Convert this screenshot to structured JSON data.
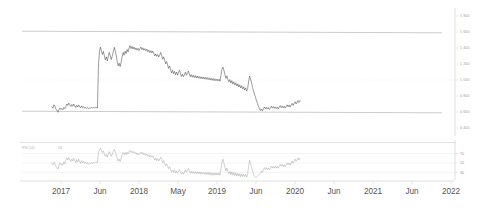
{
  "chart_data": {
    "type": "line",
    "title": "",
    "subtitle": "",
    "xlabel": "",
    "ylabel": "",
    "grid": true,
    "legend_position": "none",
    "x_tick_labels": [
      "2017",
      "Jun",
      "2018",
      "May",
      "2019",
      "Jun",
      "2020",
      "Jun",
      "2021",
      "Jun",
      "2022"
    ],
    "x_tick_positions": [
      61,
      100,
      139,
      178,
      217,
      256,
      295,
      334,
      373,
      412,
      451
    ],
    "x_range": [
      "2016-11",
      "2022-03"
    ],
    "panels": [
      {
        "name": "price",
        "ylim": [
          0.3,
          1.9
        ],
        "y_tick_labels": [
          "1 800",
          "1 600",
          "1 400",
          "1 200",
          "1 000",
          "0 800",
          "0 600",
          "0 400"
        ],
        "y_tick_values": [
          1.8,
          1.6,
          1.4,
          1.2,
          1.0,
          0.8,
          0.6,
          0.4
        ],
        "reference_lines": [
          {
            "value": 1.6,
            "style": "solid"
          },
          {
            "value": 0.6,
            "style": "solid"
          }
        ],
        "gridlines_dotted": [
          1.0
        ],
        "series": [
          {
            "name": "price",
            "color": "#4a4a4a",
            "values": [
              0.665,
              0.648,
              0.69,
              0.672,
              0.636,
              0.618,
              0.596,
              0.626,
              0.65,
              0.632,
              0.644,
              0.628,
              0.658,
              0.642,
              0.672,
              0.7,
              0.682,
              0.712,
              0.69,
              0.668,
              0.694,
              0.672,
              0.7,
              0.678,
              0.656,
              0.684,
              0.662,
              0.688,
              0.666,
              0.65,
              0.676,
              0.654,
              0.668,
              0.648,
              0.66,
              0.644,
              0.656,
              0.64,
              0.652,
              0.648,
              0.655,
              0.65,
              0.656,
              0.652,
              0.658,
              0.654,
              0.65,
              1.18,
              1.35,
              1.412,
              1.368,
              1.32,
              1.358,
              1.3,
              1.252,
              1.29,
              1.24,
              1.298,
              1.345,
              1.3,
              1.255,
              1.3,
              1.352,
              1.408,
              1.36,
              1.3,
              1.232,
              1.175,
              1.21,
              1.168,
              1.226,
              1.29,
              1.345,
              1.31,
              1.36,
              1.33,
              1.382,
              1.352,
              1.398,
              1.43,
              1.392,
              1.42,
              1.388,
              1.412,
              1.38,
              1.4,
              1.372,
              1.396,
              1.368,
              1.39,
              1.412,
              1.38,
              1.402,
              1.372,
              1.392,
              1.365,
              1.386,
              1.352,
              1.374,
              1.342,
              1.368,
              1.338,
              1.362,
              1.33,
              1.3,
              1.325,
              1.295,
              1.32,
              1.288,
              1.31,
              1.345,
              1.305,
              1.26,
              1.29,
              1.245,
              1.2,
              1.232,
              1.188,
              1.145,
              1.175,
              1.13,
              1.088,
              1.12,
              1.078,
              1.108,
              1.068,
              1.1,
              1.06,
              1.092,
              1.122,
              1.082,
              1.045,
              1.072,
              1.04,
              1.068,
              1.098,
              1.058,
              1.085,
              1.112,
              1.075,
              1.04,
              1.068,
              1.035,
              1.06,
              1.03,
              1.055,
              1.025,
              1.05,
              1.022,
              1.045,
              1.018,
              1.042,
              1.015,
              1.038,
              1.012,
              1.035,
              1.008,
              1.03,
              1.005,
              1.028,
              1.0,
              1.022,
              0.996,
              1.018,
              0.992,
              1.015,
              0.99,
              1.012,
              0.988,
              1.01,
              0.985,
              1.06,
              1.135,
              1.162,
              1.12,
              1.068,
              1.02,
              1.052,
              1.008,
              0.978,
              1.005,
              0.962,
              0.992,
              0.95,
              0.978,
              0.938,
              0.965,
              0.925,
              0.952,
              0.912,
              0.94,
              0.9,
              0.928,
              0.888,
              0.915,
              0.875,
              0.902,
              0.862,
              0.89,
              0.98,
              1.05,
              1.012,
              0.96,
              0.905,
              0.862,
              0.82,
              0.78,
              0.742,
              0.705,
              0.672,
              0.64,
              0.618,
              0.638,
              0.615,
              0.642,
              0.662,
              0.638,
              0.66,
              0.636,
              0.655,
              0.632,
              0.652,
              0.672,
              0.648,
              0.668,
              0.645,
              0.665,
              0.642,
              0.662,
              0.64,
              0.66,
              0.68,
              0.656,
              0.676,
              0.652,
              0.672,
              0.648,
              0.668,
              0.69,
              0.665,
              0.688,
              0.662,
              0.685,
              0.708,
              0.682,
              0.705,
              0.728,
              0.7,
              0.722,
              0.745,
              0.718,
              0.74
            ]
          }
        ]
      },
      {
        "name": "rsi",
        "indicator_label": "RSI (14)",
        "indicator_value": "58",
        "ylim": [
          18,
          88
        ],
        "y_tick_labels": [
          "70",
          "50",
          "30"
        ],
        "y_tick_values": [
          70,
          50,
          30
        ],
        "series": [
          {
            "name": "rsi",
            "color": "#9b9b9b",
            "values": [
              49,
              46,
              52,
              48,
              43,
              40,
              37,
              44,
              50,
              46,
              48,
              45,
              52,
              48,
              55,
              60,
              56,
              62,
              57,
              53,
              58,
              54,
              60,
              55,
              50,
              57,
              52,
              58,
              53,
              49,
              55,
              50,
              53,
              49,
              52,
              48,
              51,
              47,
              50,
              49,
              50,
              49,
              51,
              50,
              52,
              51,
              50,
              72,
              78,
              81,
              77,
              72,
              75,
              69,
              64,
              68,
              62,
              69,
              74,
              69,
              64,
              69,
              74,
              79,
              73,
              67,
              60,
              54,
              58,
              53,
              60,
              67,
              72,
              68,
              72,
              68,
              73,
              69,
              74,
              77,
              72,
              75,
              71,
              74,
              70,
              72,
              68,
              71,
              67,
              70,
              73,
              69,
              72,
              67,
              70,
              66,
              69,
              64,
              67,
              63,
              66,
              62,
              65,
              60,
              56,
              60,
              55,
              59,
              54,
              58,
              62,
              57,
              51,
              55,
              49,
              44,
              48,
              43,
              38,
              42,
              36,
              31,
              35,
              30,
              34,
              29,
              33,
              28,
              32,
              36,
              31,
              26,
              30,
              26,
              30,
              35,
              30,
              34,
              38,
              33,
              28,
              32,
              28,
              32,
              27,
              31,
              27,
              31,
              27,
              31,
              26,
              31,
              26,
              30,
              26,
              30,
              25,
              30,
              25,
              30,
              24,
              29,
              24,
              29,
              24,
              29,
              24,
              29,
              24,
              29,
              24,
              38,
              52,
              58,
              50,
              41,
              33,
              39,
              32,
              27,
              32,
              25,
              31,
              24,
              30,
              23,
              29,
              22,
              28,
              22,
              27,
              21,
              27,
              21,
              26,
              21,
              26,
              20,
              26,
              42,
              55,
              49,
              40,
              32,
              26,
              21,
              19,
              20,
              22,
              24,
              26,
              28,
              33,
              30,
              36,
              40,
              36,
              40,
              36,
              39,
              35,
              39,
              43,
              39,
              43,
              39,
              43,
              39,
              43,
              39,
              43,
              47,
              43,
              47,
              42,
              46,
              42,
              46,
              50,
              46,
              50,
              45,
              50,
              54,
              49,
              54,
              58,
              53,
              57,
              61,
              56,
              60
            ]
          }
        ]
      }
    ]
  }
}
